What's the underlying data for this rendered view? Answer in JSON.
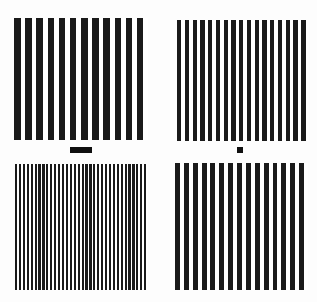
{
  "scene": {
    "title": "Vertical grating stimulus array",
    "background_color": "#fdfdfd",
    "width": 317,
    "height": 302,
    "stripe_color": "#1a1a1a",
    "marker_color": "#101010"
  },
  "panels": [
    {
      "id": "panel-top-left",
      "name": "top-left-grating",
      "position": "top-left",
      "x": 14,
      "y": 18,
      "width": 134,
      "height": 122,
      "stripe_count": 12,
      "stripe_width": 6.6,
      "gap_width": 4.6,
      "period": 11.2,
      "spatial_frequency_label": "low",
      "duty_cycle": 0.59
    },
    {
      "id": "panel-top-right",
      "name": "top-right-grating",
      "position": "top-right",
      "x": 177,
      "y": 20,
      "width": 132,
      "height": 121,
      "stripe_count": 17,
      "stripe_width": 4.3,
      "gap_width": 3.5,
      "period": 7.8,
      "spatial_frequency_label": "medium-high",
      "duty_cycle": 0.55
    },
    {
      "id": "panel-bottom-left",
      "name": "bottom-left-grating",
      "position": "bottom-left",
      "x": 15,
      "y": 164,
      "width": 133,
      "height": 126,
      "stripe_count": 34,
      "stripe_width": 2.2,
      "gap_width": 1.7,
      "period": 3.9,
      "spatial_frequency_label": "high",
      "duty_cycle": 0.56
    },
    {
      "id": "panel-bottom-right",
      "name": "bottom-right-grating",
      "position": "bottom-right",
      "x": 175,
      "y": 163,
      "width": 133,
      "height": 127,
      "stripe_count": 15,
      "stripe_width": 5.0,
      "gap_width": 3.9,
      "period": 8.9,
      "spatial_frequency_label": "medium",
      "duty_cycle": 0.56
    }
  ],
  "markers": [
    {
      "id": "marker-left",
      "name": "left-reference-bar",
      "shape": "wide-bar",
      "x": 70,
      "y": 147,
      "width": 22,
      "height": 6
    },
    {
      "id": "marker-right",
      "name": "right-reference-square",
      "shape": "small-square",
      "x": 237,
      "y": 147,
      "width": 6,
      "height": 6
    }
  ]
}
